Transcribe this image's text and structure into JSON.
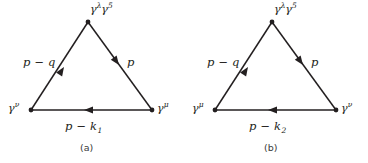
{
  "figure": {
    "background_color": "#ffffff",
    "line_color": "#231f20",
    "panels": [
      {
        "id": "a",
        "caption": "(a)",
        "apex_label_gamma": "γ",
        "apex_label_sup1": "λ",
        "apex_label_gamma2": "γ",
        "apex_label_sup2": "5",
        "left_vertex_gamma": "γ",
        "left_vertex_sup": "ν",
        "right_vertex_gamma": "γ",
        "right_vertex_sup": "μ",
        "left_edge_momentum": "p − q",
        "right_edge_momentum": "p",
        "bottom_edge_momentum": "p − k",
        "bottom_edge_subscript": "1",
        "left_edge_arrow_direction": "up-right",
        "right_edge_arrow_direction": "down-right",
        "bottom_edge_arrow_direction": "left"
      },
      {
        "id": "b",
        "caption": "(b)",
        "apex_label_gamma": "γ",
        "apex_label_sup1": "λ",
        "apex_label_gamma2": "γ",
        "apex_label_sup2": "5",
        "left_vertex_gamma": "γ",
        "left_vertex_sup": "μ",
        "right_vertex_gamma": "γ",
        "right_vertex_sup": "ν",
        "left_edge_momentum": "p − q",
        "right_edge_momentum": "p",
        "bottom_edge_momentum": "p − k",
        "bottom_edge_subscript": "2",
        "left_edge_arrow_direction": "up-right",
        "right_edge_arrow_direction": "down-right",
        "bottom_edge_arrow_direction": "left"
      }
    ]
  }
}
